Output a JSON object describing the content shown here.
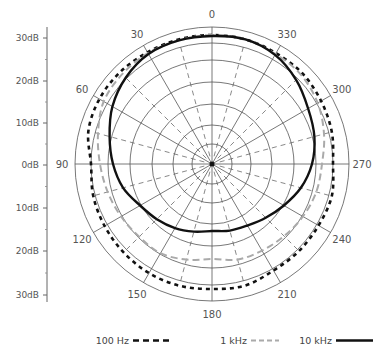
{
  "chart_data": {
    "type": "polar",
    "title": "",
    "angle_labels": [
      "0",
      "30",
      "60",
      "90",
      "120",
      "150",
      "180",
      "210",
      "240",
      "270",
      "300",
      "330"
    ],
    "angle_label_degrees": [
      0,
      30,
      60,
      90,
      120,
      150,
      180,
      210,
      240,
      270,
      300,
      330
    ],
    "angle_direction": "counterclockwise from top",
    "radial_axis": {
      "ticks": [
        "30dB",
        "20dB",
        "10dB",
        "0dB",
        "10dB",
        "20dB",
        "30dB"
      ],
      "tick_y": [
        38,
        81,
        123,
        165,
        208,
        251,
        295
      ]
    },
    "grid": {
      "rings_px": [
        20,
        39,
        60,
        82,
        104,
        121,
        137
      ],
      "solid_spokes_every_deg": 30,
      "dashed_spokes_offset_deg": 15
    },
    "angles_deg": [
      0,
      15,
      30,
      45,
      60,
      75,
      90,
      105,
      120,
      135,
      150,
      165,
      180,
      195,
      210,
      225,
      240,
      255,
      270,
      285,
      300,
      315,
      330,
      345
    ],
    "series": [
      {
        "name": "100 Hz",
        "style": "dotted-bold",
        "color": "#111111",
        "radius_px": [
          129,
          129,
          129,
          130,
          130,
          128,
          121,
          123,
          124,
          125,
          126,
          126,
          125,
          126,
          123,
          123,
          123,
          124,
          121,
          124,
          126,
          128,
          128,
          129
        ]
      },
      {
        "name": "1 kHz",
        "style": "dashed",
        "color": "#aaaaaa",
        "radius_px": [
          129,
          128,
          128,
          127,
          125,
          118,
          112,
          108,
          105,
          103,
          103,
          99,
          95,
          99,
          100,
          102,
          105,
          108,
          110,
          116,
          122,
          126,
          127,
          129
        ]
      },
      {
        "name": "10 kHz",
        "style": "solid",
        "color": "#111111",
        "radius_px": [
          128,
          128,
          127,
          122,
          115,
          106,
          99,
          92,
          83,
          78,
          74,
          70,
          67,
          69,
          71,
          76,
          83,
          92,
          100,
          106,
          111,
          119,
          126,
          129
        ]
      }
    ],
    "legend": [
      {
        "label": "100 Hz"
      },
      {
        "label": "1 kHz"
      },
      {
        "label": "10 kHz"
      }
    ],
    "legend_position": "bottom"
  }
}
